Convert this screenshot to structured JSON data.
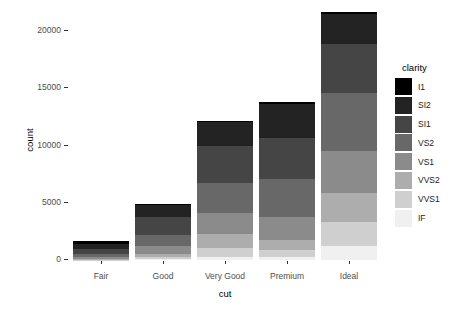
{
  "figure": {
    "background_color": "#ffffff"
  },
  "chart_data": {
    "type": "bar",
    "subtype": "stacked",
    "title": "",
    "xlabel": "cut",
    "ylabel": "count",
    "categories": [
      "Fair",
      "Good",
      "Very Good",
      "Premium",
      "Ideal"
    ],
    "series": [
      {
        "name": "I1",
        "color": "#000000",
        "values": [
          210,
          96,
          84,
          205,
          146
        ]
      },
      {
        "name": "SI2",
        "color": "#232323",
        "values": [
          466,
          1081,
          2100,
          2949,
          2598
        ]
      },
      {
        "name": "SI1",
        "color": "#454545",
        "values": [
          408,
          1560,
          3240,
          3575,
          4282
        ]
      },
      {
        "name": "VS2",
        "color": "#686868",
        "values": [
          261,
          978,
          2591,
          3357,
          5071
        ]
      },
      {
        "name": "VS1",
        "color": "#8b8b8b",
        "values": [
          170,
          648,
          1775,
          1989,
          3589
        ]
      },
      {
        "name": "VVS2",
        "color": "#adadad",
        "values": [
          69,
          286,
          1235,
          870,
          2606
        ]
      },
      {
        "name": "VVS1",
        "color": "#cfcfcf",
        "values": [
          17,
          186,
          789,
          616,
          2047
        ]
      },
      {
        "name": "IF",
        "color": "#f0f0f0",
        "values": [
          9,
          71,
          268,
          230,
          1212
        ]
      }
    ],
    "bar_totals": [
      1610,
      4906,
      12082,
      13791,
      21551
    ],
    "stack_order": "first_series_on_top",
    "ylim": [
      0,
      21551
    ],
    "yticks": [
      0,
      5000,
      10000,
      15000,
      20000
    ],
    "ytick_labels": [
      "0",
      "5000",
      "10000",
      "15000",
      "20000"
    ],
    "grid": "off",
    "legend": {
      "title": "clarity",
      "position": "right",
      "entries": [
        "I1",
        "SI2",
        "SI1",
        "VS2",
        "VS1",
        "VVS2",
        "VVS1",
        "IF"
      ]
    },
    "tick_text_color": "#4d4d4d",
    "axis_title_color": "#000000"
  }
}
